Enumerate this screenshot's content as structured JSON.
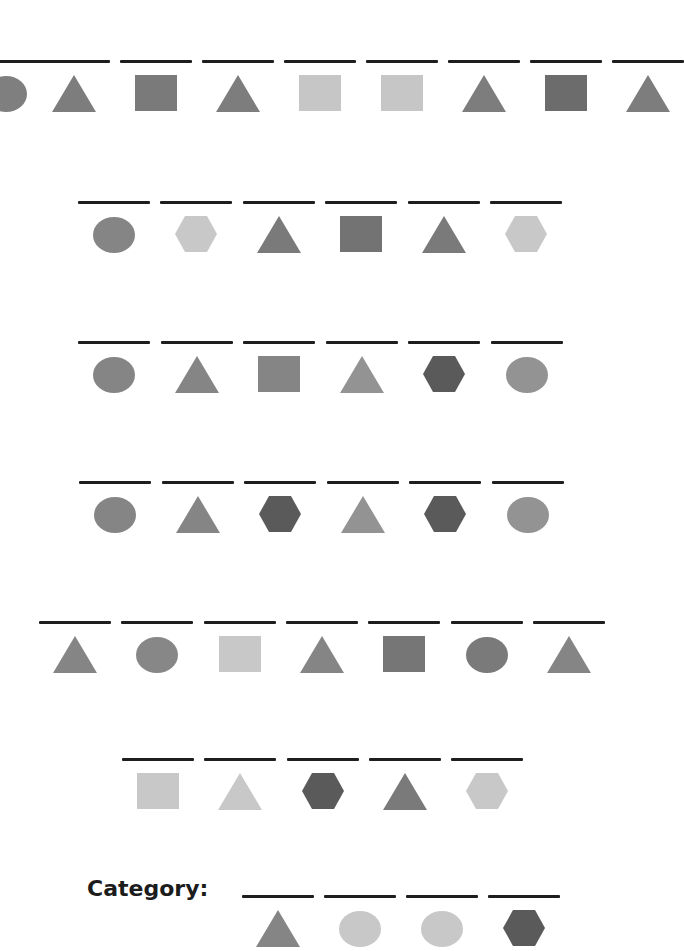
{
  "colors": {
    "line": "#1e1e1e",
    "mid_gray": "#868686",
    "dark_gray": "#5a5a5a",
    "light_gray": "#c4c4c4",
    "medium_gray": "#8f8f8f"
  },
  "rows": [
    {
      "top": 60,
      "shapes": [
        {
          "shape": "circle",
          "color": "#7f7f7f",
          "x": -30
        },
        {
          "shape": "triangle",
          "color": "#7d7d7d",
          "x": 38
        },
        {
          "shape": "square",
          "color": "#7a7a7a",
          "x": 120
        },
        {
          "shape": "triangle",
          "color": "#7d7d7d",
          "x": 202
        },
        {
          "shape": "square",
          "color": "#c6c6c6",
          "x": 284
        },
        {
          "shape": "square",
          "color": "#c6c6c6",
          "x": 366
        },
        {
          "shape": "triangle",
          "color": "#7d7d7d",
          "x": 448
        },
        {
          "shape": "square",
          "color": "#6c6c6c",
          "x": 530
        },
        {
          "shape": "triangle",
          "color": "#7d7d7d",
          "x": 612
        }
      ]
    },
    {
      "top": 201,
      "shapes": [
        {
          "shape": "circle",
          "color": "#858585",
          "x": 78
        },
        {
          "shape": "hexagon",
          "color": "#c8c8c8",
          "x": 160
        },
        {
          "shape": "triangle",
          "color": "#7a7a7a",
          "x": 243
        },
        {
          "shape": "square",
          "color": "#737373",
          "x": 325
        },
        {
          "shape": "triangle",
          "color": "#7a7a7a",
          "x": 408
        },
        {
          "shape": "hexagon",
          "color": "#c8c8c8",
          "x": 490
        }
      ]
    },
    {
      "top": 341,
      "shapes": [
        {
          "shape": "circle",
          "color": "#858585",
          "x": 78
        },
        {
          "shape": "triangle",
          "color": "#858585",
          "x": 161
        },
        {
          "shape": "square",
          "color": "#858585",
          "x": 243
        },
        {
          "shape": "triangle",
          "color": "#939393",
          "x": 326
        },
        {
          "shape": "hexagon",
          "color": "#5a5a5a",
          "x": 408
        },
        {
          "shape": "circle",
          "color": "#939393",
          "x": 491
        }
      ]
    },
    {
      "top": 481,
      "shapes": [
        {
          "shape": "circle",
          "color": "#858585",
          "x": 79
        },
        {
          "shape": "triangle",
          "color": "#858585",
          "x": 162
        },
        {
          "shape": "hexagon",
          "color": "#5a5a5a",
          "x": 244
        },
        {
          "shape": "triangle",
          "color": "#939393",
          "x": 327
        },
        {
          "shape": "hexagon",
          "color": "#5a5a5a",
          "x": 409
        },
        {
          "shape": "circle",
          "color": "#939393",
          "x": 492
        }
      ]
    },
    {
      "top": 621,
      "shapes": [
        {
          "shape": "triangle",
          "color": "#858585",
          "x": 39
        },
        {
          "shape": "circle",
          "color": "#878787",
          "x": 121
        },
        {
          "shape": "square",
          "color": "#c8c8c8",
          "x": 204
        },
        {
          "shape": "triangle",
          "color": "#858585",
          "x": 286
        },
        {
          "shape": "square",
          "color": "#767676",
          "x": 368
        },
        {
          "shape": "circle",
          "color": "#7a7a7a",
          "x": 451
        },
        {
          "shape": "triangle",
          "color": "#858585",
          "x": 533
        }
      ]
    },
    {
      "top": 758,
      "shapes": [
        {
          "shape": "square",
          "color": "#c8c8c8",
          "x": 122
        },
        {
          "shape": "triangle",
          "color": "#c8c8c8",
          "x": 204
        },
        {
          "shape": "hexagon",
          "color": "#5a5a5a",
          "x": 287
        },
        {
          "shape": "triangle",
          "color": "#7a7a7a",
          "x": 369
        },
        {
          "shape": "hexagon",
          "color": "#c8c8c8",
          "x": 451
        }
      ]
    },
    {
      "top": 895,
      "shapes": [
        {
          "shape": "triangle",
          "color": "#858585",
          "x": 242
        },
        {
          "shape": "circle",
          "color": "#c8c8c8",
          "x": 324
        },
        {
          "shape": "circle",
          "color": "#c8c8c8",
          "x": 406
        },
        {
          "shape": "hexagon",
          "color": "#5a5a5a",
          "x": 488
        }
      ]
    }
  ],
  "category": {
    "label": "Category:"
  }
}
